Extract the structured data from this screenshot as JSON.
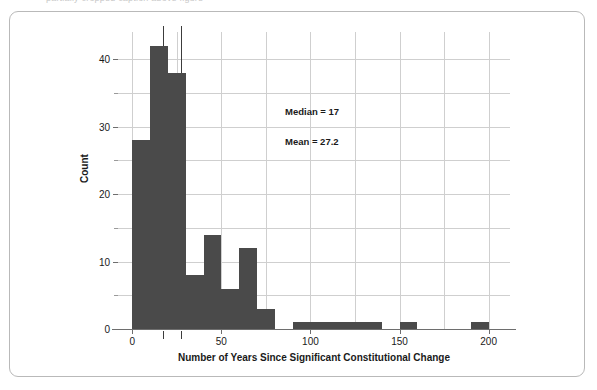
{
  "caption": {
    "text": "partially cropped caption above figure"
  },
  "figure": {
    "frame_color": "#b9b9b9",
    "background": "#ffffff"
  },
  "annotations": {
    "median_label": "Median = 17",
    "mean_label": "Mean = 27.2"
  },
  "chart_data": {
    "type": "bar",
    "title": "",
    "xlabel": "Number of Years Since Significant Constitutional Change",
    "ylabel": "Count",
    "xlim": [
      -8,
      212
    ],
    "ylim": [
      0,
      44
    ],
    "bin_width": 10,
    "bar_color": "#4a4a4a",
    "grid": true,
    "grid_x_step": 25,
    "grid_y_step": 5,
    "legend": "none",
    "xticks": [
      0,
      50,
      100,
      150,
      200
    ],
    "xtick_labels": [
      "0",
      "50",
      "100",
      "150",
      "200"
    ],
    "yticks": [
      0,
      10,
      20,
      30,
      40
    ],
    "ytick_labels": [
      "0",
      "10",
      "20",
      "30",
      "40"
    ],
    "yticks_minor": [
      5,
      15,
      25,
      35
    ],
    "categories": [
      "0-10",
      "10-20",
      "20-30",
      "30-40",
      "40-50",
      "50-60",
      "60-70",
      "70-80",
      "80-90",
      "90-100",
      "100-110",
      "110-120",
      "120-130",
      "130-140",
      "140-150",
      "150-160",
      "160-170",
      "170-180",
      "180-190",
      "190-200"
    ],
    "bin_starts": [
      0,
      10,
      20,
      30,
      40,
      50,
      60,
      70,
      80,
      90,
      100,
      110,
      120,
      130,
      140,
      150,
      160,
      170,
      180,
      190
    ],
    "values": [
      28,
      42,
      38,
      8,
      14,
      6,
      12,
      3,
      0,
      1,
      1,
      1,
      1,
      1,
      0,
      1,
      0,
      0,
      0,
      1
    ],
    "statistics": {
      "median": 17,
      "mean": 27.2
    },
    "reference_lines": [
      {
        "name": "median",
        "value": 17,
        "label": "Median = 17"
      },
      {
        "name": "mean",
        "value": 27.2,
        "label": "Mean = 27.2"
      }
    ]
  }
}
